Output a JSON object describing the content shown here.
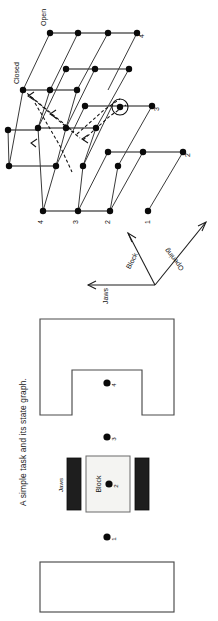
{
  "figure": {
    "caption": "A simple task and its state graph.",
    "orientation": "rotated-90-ccw"
  },
  "state_graph": {
    "name": "state-graph",
    "axes": [
      {
        "id": "jaws",
        "label": "Jaws"
      },
      {
        "id": "block",
        "label": "Block"
      },
      {
        "id": "opening",
        "label": "Opening"
      }
    ],
    "opening_levels": [
      {
        "id": "open",
        "label": "Open"
      },
      {
        "id": "closed",
        "label": "Closed"
      }
    ],
    "jaws_positions": [
      {
        "id": "j4",
        "label": "4"
      },
      {
        "id": "j3",
        "label": "3"
      },
      {
        "id": "j2",
        "label": "2"
      },
      {
        "id": "j1",
        "label": "1"
      }
    ],
    "block_positions": [
      {
        "id": "b4",
        "label": "4"
      },
      {
        "id": "b3",
        "label": "3"
      },
      {
        "id": "b2",
        "label": "2"
      },
      {
        "id": "b1",
        "label": "1"
      }
    ],
    "highlighted_state": {
      "id": "start-state",
      "label": ""
    },
    "solution_path_style": "dashed-with-arrows"
  },
  "task_scene": {
    "name": "task-scene",
    "fixture": {
      "id": "notched-fixture",
      "label": ""
    },
    "table": {
      "id": "table-surface",
      "label": ""
    },
    "block": {
      "id": "block",
      "label": "Block"
    },
    "jaws": {
      "id": "jaws",
      "label": "Jaws"
    },
    "positions": [
      {
        "id": "p4",
        "label": "4"
      },
      {
        "id": "p3",
        "label": "3"
      },
      {
        "id": "p2",
        "label": "2"
      },
      {
        "id": "p1",
        "label": "1"
      }
    ]
  },
  "colors": {
    "ink": "#111111",
    "node": "#0a0a0a",
    "edge": "#3a3a3a",
    "outline": "#4a4a4a",
    "jaw": "#1e1e1e",
    "block_fill": "#f4f4f2",
    "background": "#ffffff"
  }
}
